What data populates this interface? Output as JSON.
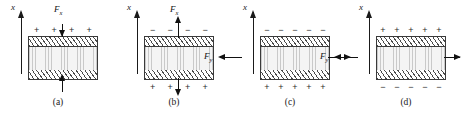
{
  "figure": {
    "axis_label": "x",
    "panels": [
      {
        "id": "a",
        "caption": "(a)",
        "force_label": "F",
        "force_sub": "x",
        "force_direction": "vertical-compression",
        "top_charges": [
          "+",
          "+",
          "+",
          "+"
        ],
        "bottom_charges": [
          "−",
          "−",
          "−",
          "−"
        ],
        "arrow_top": "down",
        "arrow_bottom": "up"
      },
      {
        "id": "b",
        "caption": "(b)",
        "force_label": "F",
        "force_sub": "x",
        "force_direction": "vertical-tension",
        "top_charges": [
          "−",
          "−",
          "−",
          "−"
        ],
        "bottom_charges": [
          "+",
          "+",
          "+",
          "+"
        ],
        "arrow_top": "up",
        "arrow_bottom": "down"
      },
      {
        "id": "c",
        "caption": "(c)",
        "force_label": "F",
        "force_sub": "y",
        "force_direction": "horizontal-tension",
        "top_charges": [
          "−",
          "−",
          "−",
          "−",
          "−"
        ],
        "bottom_charges": [
          "+",
          "+",
          "+",
          "+",
          "+"
        ],
        "arrow_left": "left",
        "arrow_right": "right"
      },
      {
        "id": "d",
        "caption": "(d)",
        "force_label": "F",
        "force_sub": "y",
        "force_direction": "horizontal-tension",
        "top_charges": [
          "+",
          "+",
          "+",
          "+",
          "+"
        ],
        "bottom_charges": [
          "−",
          "−",
          "−",
          "−",
          "−"
        ],
        "arrow_left": "left",
        "arrow_right": "right"
      }
    ],
    "colors": {
      "line": "#1a1a1a",
      "electrode_hatch": "#4a4a4a",
      "core_fill": "#f4f4f4",
      "background": "#ffffff"
    }
  }
}
